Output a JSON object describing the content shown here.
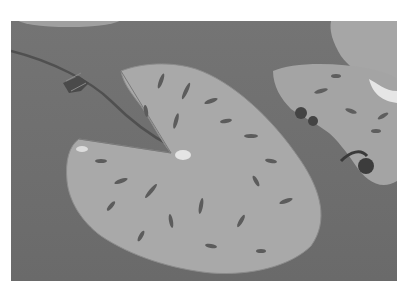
{
  "image": {
    "subject": "Lily pads floating on water",
    "style": "grayscale photograph",
    "colors": {
      "background": "#ffffff",
      "water": "#6e6e6e",
      "pad": "#a8a8a8",
      "pad_spots": "#5a5a5a",
      "highlight": "#e8e8e8"
    }
  }
}
